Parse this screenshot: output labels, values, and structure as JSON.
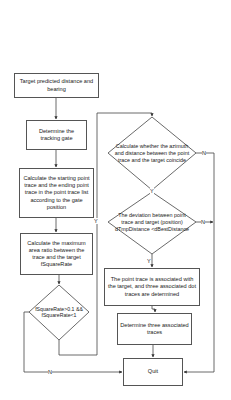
{
  "diagram": {
    "type": "flowchart",
    "nodes": {
      "start": "Target predicted distance and bearing",
      "gate": "Determine the tracking gate",
      "calc_trace": "Calculate the starting point trace and the ending point trace in the point trace list according to the gate position",
      "calc_ratio": "Calculate the maximum area ratio between the trace and the target fSquareRate",
      "decision_ratio": "fSquareRate>0.1 && fSquareRate<1",
      "decision_coincide": "Calculate whether the azimuth and distance between the point trace and the target coincide",
      "decision_deviation": "The deviation between point trace and target (position) dTmpDistance <dBestDistance",
      "associated": "The point trace is associated with the target, and three associated dot traces are determined",
      "determine_three": "Determine three associated traces",
      "quit": "Quit"
    },
    "edge_labels": {
      "ratio_yes": "Y",
      "ratio_no": "N",
      "coincide_yes": "Y",
      "coincide_no": "N",
      "deviation_yes": "Y",
      "deviation_no": "N"
    },
    "colors": {
      "line": "#333333",
      "border": "#555555",
      "background": "#ffffff"
    }
  }
}
